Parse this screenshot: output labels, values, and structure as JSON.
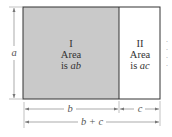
{
  "diagram": {
    "type": "area-rectangle-distributive",
    "colors": {
      "region_I_fill": "#c9c9c9",
      "region_II_fill": "#ffffff",
      "stroke": "#333333",
      "dimension_line": "#888888"
    },
    "regions": [
      {
        "numeral": "I",
        "line1": "Area",
        "line2_prefix": "is ",
        "line2_var": "ab"
      },
      {
        "numeral": "II",
        "line1": "Area",
        "line2_prefix": "is ",
        "line2_var": "ac"
      }
    ],
    "dimensions": {
      "height": "a",
      "width_left": "b",
      "width_right": "c",
      "width_total": "b + c"
    },
    "cropped_margin_text": [
      "·",
      "·",
      "·",
      "·"
    ]
  }
}
